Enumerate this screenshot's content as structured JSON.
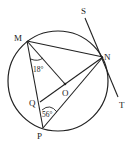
{
  "diagram": {
    "type": "circle-geometry",
    "circle": {
      "cx": 58,
      "cy": 81,
      "r": 50
    },
    "points": {
      "M": {
        "label": "M",
        "x": 27,
        "y": 41
      },
      "N": {
        "label": "N",
        "x": 103,
        "y": 57
      },
      "P": {
        "label": "P",
        "x": 43,
        "y": 128
      },
      "Q": {
        "label": "Q",
        "x": 40,
        "y": 102
      },
      "O": {
        "label": "O",
        "x": 65,
        "y": 84
      },
      "S": {
        "label": "S",
        "x": 85,
        "y": 12
      },
      "T": {
        "label": "T",
        "x": 120,
        "y": 103
      }
    },
    "segments": [
      "MN",
      "MP",
      "MO",
      "QN",
      "PN",
      "ST"
    ],
    "angles": [
      {
        "label": "18°",
        "at": "M",
        "between": [
          "MP",
          "MO"
        ]
      },
      {
        "label": "56°",
        "at": "Q",
        "between": [
          "QP",
          "QN"
        ]
      }
    ],
    "tangent_line": "ST"
  }
}
